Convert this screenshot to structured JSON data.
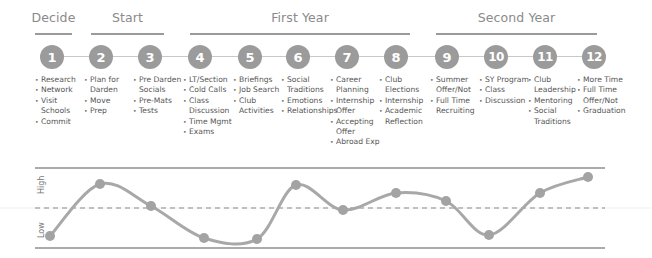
{
  "sections": [
    {
      "label": "Decide",
      "x": 35,
      "w": 37
    },
    {
      "label": "Start",
      "x": 91,
      "w": 73
    },
    {
      "label": "First Year",
      "x": 190,
      "w": 220
    },
    {
      "label": "Second Year",
      "x": 436,
      "w": 161
    }
  ],
  "steps": [
    {
      "number": "1",
      "cx": 52,
      "items": [
        "Research",
        "Network",
        "Visit",
        "Schools",
        "Commit"
      ],
      "continuations": [
        3
      ]
    },
    {
      "number": "2",
      "cx": 101,
      "items": [
        "Plan for",
        "Darden",
        "Move",
        "Prep"
      ],
      "continuations": [
        1
      ]
    },
    {
      "number": "3",
      "cx": 150,
      "items": [
        "Pre Darden",
        "Socials",
        "Pre-Mats",
        "Tests"
      ],
      "continuations": [
        1
      ]
    },
    {
      "number": "4",
      "cx": 200,
      "items": [
        "LT/Section",
        "Cold Calls",
        "Class",
        "Discussion",
        "Time Mgmt",
        "Exams"
      ],
      "continuations": [
        3
      ]
    },
    {
      "number": "5",
      "cx": 250,
      "items": [
        "Briefings",
        "Job Search",
        "Club",
        "Activities"
      ],
      "continuations": [
        3
      ]
    },
    {
      "number": "6",
      "cx": 298,
      "items": [
        "Social",
        "Traditions",
        "Emotions",
        "Relationships"
      ],
      "continuations": [
        1
      ]
    },
    {
      "number": "7",
      "cx": 347,
      "items": [
        "Career",
        "Planning",
        "Internship",
        "Offer",
        "Accepting",
        "Offer",
        "Abroad Exp"
      ],
      "continuations": [
        1,
        3,
        5
      ]
    },
    {
      "number": "8",
      "cx": 396,
      "items": [
        "Club",
        "Elections",
        "Internship",
        "Academic",
        "Reflection"
      ],
      "continuations": [
        1,
        4
      ]
    },
    {
      "number": "9",
      "cx": 447,
      "items": [
        "Summer",
        "Offer/Not",
        "Full Time",
        "Recruiting"
      ],
      "continuations": [
        1,
        3
      ]
    },
    {
      "number": "10",
      "cx": 496,
      "items": [
        "SY Program",
        "Class",
        "Discussion"
      ],
      "continuations": []
    },
    {
      "number": "11",
      "cx": 545,
      "items": [
        "Club",
        "Leadership",
        "Mentoring",
        "Social",
        "Traditions"
      ],
      "continuations": [
        1,
        4
      ]
    },
    {
      "number": "12",
      "cx": 594,
      "items": [
        "More Time",
        "Full Time",
        "Offer/Not",
        "Graduation"
      ],
      "continuations": [
        2
      ]
    }
  ],
  "colors": {
    "circle": "#9b9b9b",
    "line": "#9a9a9a",
    "curve": "#a8a8a8",
    "text": "#555555"
  },
  "chart_data": {
    "type": "line",
    "title": "",
    "xlabel": "",
    "ylabel": "",
    "y_labels": {
      "high": "High",
      "low": "Low"
    },
    "categories": [
      "1",
      "2",
      "3",
      "4",
      "5",
      "6",
      "7",
      "8",
      "9",
      "10",
      "11",
      "12"
    ],
    "values": [
      0.15,
      0.8,
      0.52,
      0.12,
      0.11,
      0.79,
      0.47,
      0.68,
      0.58,
      0.16,
      0.68,
      0.88
    ],
    "ylim": [
      0,
      1
    ],
    "midline": 0.5,
    "midline_style": "dashed",
    "grid": false,
    "points_px": [
      [
        50,
        86
      ],
      [
        100,
        34
      ],
      [
        151,
        56
      ],
      [
        204,
        88
      ],
      [
        257,
        89
      ],
      [
        296,
        35
      ],
      [
        343,
        60
      ],
      [
        396,
        43
      ],
      [
        446,
        51
      ],
      [
        489,
        85
      ],
      [
        540,
        43
      ],
      [
        588,
        27
      ]
    ]
  }
}
